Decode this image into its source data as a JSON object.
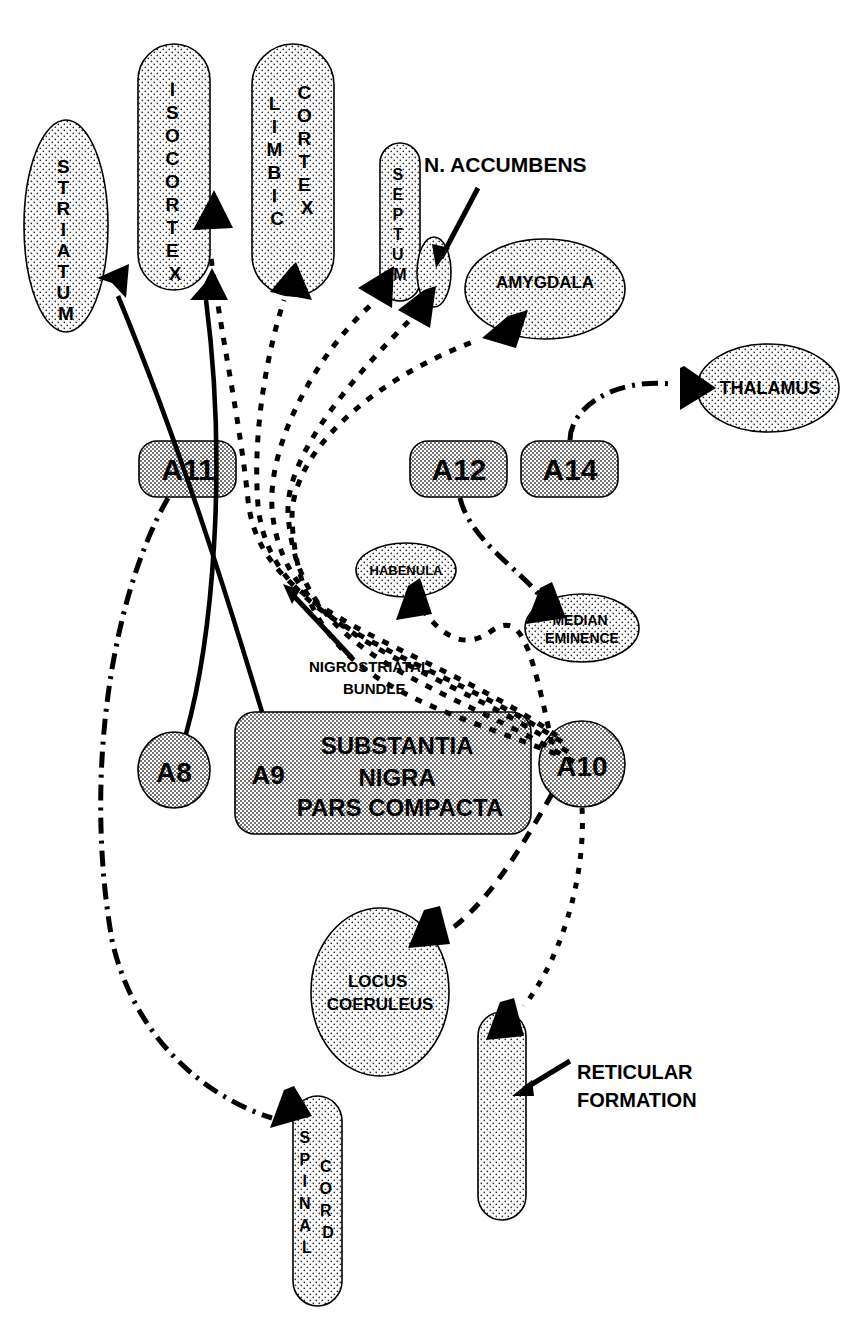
{
  "diagram": {
    "colors": {
      "stipple_light": "#f2f2f2",
      "stipple_dark": "#cfcfcf",
      "outline": "#000000",
      "arrow": "#000000",
      "background": "#ffffff"
    },
    "nodes": [
      {
        "id": "striatum",
        "label": "STRIATUM",
        "shape": "ellipse",
        "orientation": "vertical-stack",
        "fill": "light",
        "cx": 66,
        "cy": 226,
        "rx": 42,
        "ry": 106
      },
      {
        "id": "isocortex",
        "label": "ISOCORTEX",
        "shape": "capsule",
        "orientation": "vertical-stack",
        "fill": "light",
        "x": 138,
        "y": 44,
        "w": 72,
        "h": 246
      },
      {
        "id": "limbic-cortex",
        "label": "LIMBIC CORTEX",
        "label_col1": "LIMBIC",
        "label_col2": "CORTEX",
        "shape": "capsule",
        "orientation": "vertical-two-column",
        "fill": "light",
        "x": 252,
        "y": 44,
        "w": 82,
        "h": 252
      },
      {
        "id": "septum",
        "label": "SEPTUM",
        "shape": "capsule",
        "orientation": "vertical-stack",
        "fill": "light",
        "x": 380,
        "y": 143,
        "w": 40,
        "h": 158
      },
      {
        "id": "n-accumbens-blob",
        "label": "",
        "shape": "ellipse",
        "orientation": "none",
        "fill": "light",
        "cx": 434,
        "cy": 272,
        "rx": 17,
        "ry": 35
      },
      {
        "id": "amygdala",
        "label": "AMYGDALA",
        "shape": "ellipse",
        "orientation": "horizontal",
        "fill": "light",
        "cx": 545,
        "cy": 289,
        "rx": 80,
        "ry": 50
      },
      {
        "id": "thalamus",
        "label": "THALAMUS",
        "shape": "ellipse",
        "orientation": "horizontal",
        "fill": "light",
        "cx": 768,
        "cy": 388,
        "rx": 71,
        "ry": 44
      },
      {
        "id": "a11",
        "label": "A11",
        "shape": "roundrect",
        "orientation": "horizontal",
        "fill": "dark",
        "x": 139,
        "y": 441,
        "w": 97,
        "h": 56
      },
      {
        "id": "a12",
        "label": "A12",
        "shape": "roundrect",
        "orientation": "horizontal",
        "fill": "dark",
        "x": 410,
        "y": 441,
        "w": 97,
        "h": 56
      },
      {
        "id": "a14",
        "label": "A14",
        "shape": "roundrect",
        "orientation": "horizontal",
        "fill": "dark",
        "x": 521,
        "y": 441,
        "w": 97,
        "h": 56
      },
      {
        "id": "habenula",
        "label": "HABENULA",
        "shape": "ellipse",
        "orientation": "horizontal",
        "fill": "light",
        "cx": 406,
        "cy": 570,
        "rx": 50,
        "ry": 27
      },
      {
        "id": "median-eminence",
        "label": "MEDIAN EMINENCE",
        "label_line1": "MEDIAN",
        "label_line2": "EMINENCE",
        "shape": "ellipse",
        "orientation": "horizontal-two-line",
        "fill": "light",
        "cx": 582,
        "cy": 628,
        "rx": 57,
        "ry": 34
      },
      {
        "id": "a8",
        "label": "A8",
        "shape": "ellipse",
        "orientation": "horizontal",
        "fill": "dark",
        "cx": 174,
        "cy": 770,
        "rx": 36,
        "ry": 38
      },
      {
        "id": "substantia-nigra",
        "label": "SUBSTANTIA NIGRA PARS COMPACTA",
        "label_line1": "SUBSTANTIA",
        "label_line2": "NIGRA",
        "label_line3": "PARS COMPACTA",
        "shape": "roundrect",
        "orientation": "horizontal-three-line",
        "fill": "dark",
        "x": 235,
        "y": 712,
        "w": 296,
        "h": 122
      },
      {
        "id": "a9",
        "label": "A9",
        "shape": "inline-text",
        "orientation": "horizontal",
        "fill": "none",
        "cx": 268,
        "cy": 773
      },
      {
        "id": "a10",
        "label": "A10",
        "shape": "ellipse",
        "orientation": "horizontal",
        "fill": "dark",
        "cx": 582,
        "cy": 764,
        "rx": 43,
        "ry": 43
      },
      {
        "id": "locus-coeruleus",
        "label": "LOCUS COERULEUS",
        "label_line1": "LOCUS",
        "label_line2": "COERULEUS",
        "shape": "ellipse",
        "orientation": "horizontal-two-line",
        "fill": "light",
        "cx": 380,
        "cy": 992,
        "rx": 69,
        "ry": 84
      },
      {
        "id": "reticular-formation-body",
        "label": "",
        "shape": "capsule",
        "orientation": "none",
        "fill": "light",
        "x": 478,
        "y": 1012,
        "w": 48,
        "h": 208
      },
      {
        "id": "spinal-cord",
        "label": "SPINAL CORD",
        "label_col1": "SPINAL",
        "label_col2": "CORD",
        "shape": "capsule",
        "orientation": "vertical-two-column",
        "fill": "light",
        "x": 293,
        "y": 1096,
        "w": 49,
        "h": 210
      }
    ],
    "callouts": [
      {
        "id": "n-accumbens",
        "label": "N. ACCUMBENS",
        "x": 424,
        "y": 168,
        "anchor": "start",
        "leader_from": [
          478,
          188
        ],
        "leader_to": [
          437,
          262
        ]
      },
      {
        "id": "nigrostriatal-bundle",
        "label": "NIGROSTRIATAL BUNDLE",
        "label_line1": "NIGROSTRIATAL",
        "label_line2": "BUNDLE",
        "x": 309,
        "y": 672,
        "anchor": "start",
        "leader_from": [
          352,
          660
        ],
        "leader_to": [
          287,
          587
        ]
      },
      {
        "id": "reticular-formation",
        "label": "RETICULAR FORMATION",
        "label_line1": "RETICULAR",
        "label_line2": "FORMATION",
        "x": 577,
        "y": 1078,
        "anchor": "start",
        "leader_from": [
          572,
          1060
        ],
        "leader_to": [
          516,
          1093
        ]
      }
    ],
    "connections": [
      {
        "id": "a9-to-striatum",
        "from": "a9",
        "to": "striatum",
        "style": "solid",
        "arrowhead": true
      },
      {
        "id": "a8-to-isocortex",
        "from": "a8",
        "to": "isocortex",
        "style": "solid",
        "arrowhead": true
      },
      {
        "id": "a10-to-isocortex",
        "from": "a10",
        "to": "isocortex",
        "style": "dotted",
        "arrowhead": true
      },
      {
        "id": "a10-to-limbic-cortex",
        "from": "a10",
        "to": "limbic-cortex",
        "style": "dotted",
        "arrowhead": true
      },
      {
        "id": "a10-to-septum",
        "from": "a10",
        "to": "septum",
        "style": "dotted",
        "arrowhead": true
      },
      {
        "id": "a10-to-n-accumbens",
        "from": "a10",
        "to": "n-accumbens-blob",
        "style": "dotted",
        "arrowhead": true
      },
      {
        "id": "a10-to-amygdala",
        "from": "a10",
        "to": "amygdala",
        "style": "dotted",
        "arrowhead": true
      },
      {
        "id": "a10-to-habenula",
        "from": "a10",
        "to": "habenula",
        "style": "dotted",
        "arrowhead": true
      },
      {
        "id": "a10-to-locus-coeruleus",
        "from": "a10",
        "to": "locus-coeruleus",
        "style": "dashed",
        "arrowhead": true
      },
      {
        "id": "a10-to-reticular",
        "from": "a10",
        "to": "reticular-formation-body",
        "style": "dotted",
        "arrowhead": true
      },
      {
        "id": "a12-to-median-eminence",
        "from": "a12",
        "to": "median-eminence",
        "style": "dashdot",
        "arrowhead": true
      },
      {
        "id": "a14-to-thalamus",
        "from": "a14",
        "to": "thalamus",
        "style": "dashdot",
        "arrowhead": true
      },
      {
        "id": "a11-to-spinal-cord",
        "from": "a11",
        "to": "spinal-cord",
        "style": "dashdot",
        "arrowhead": true
      }
    ]
  }
}
